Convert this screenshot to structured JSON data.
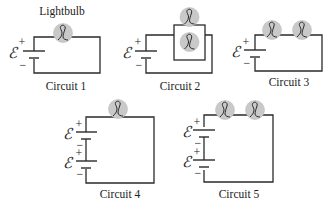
{
  "diagram": {
    "lightbulb_label": "Lightbulb",
    "emf_symbol": "ℰ",
    "plus": "+",
    "minus": "−",
    "circuits": [
      {
        "label": "Circuit 1",
        "bulbs": 1,
        "bulb_arrangement": "single",
        "batteries": 1
      },
      {
        "label": "Circuit 2",
        "bulbs": 2,
        "bulb_arrangement": "parallel",
        "batteries": 1
      },
      {
        "label": "Circuit 3",
        "bulbs": 2,
        "bulb_arrangement": "series",
        "batteries": 1
      },
      {
        "label": "Circuit 4",
        "bulbs": 1,
        "bulb_arrangement": "single",
        "batteries": 2
      },
      {
        "label": "Circuit 5",
        "bulbs": 2,
        "bulb_arrangement": "series",
        "batteries": 2
      }
    ],
    "colors": {
      "wire": "#2a2a2a",
      "bulb_fill": "#c9c9c9",
      "background": "#ffffff"
    }
  }
}
